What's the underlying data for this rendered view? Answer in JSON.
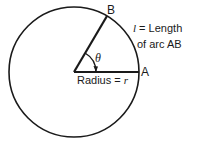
{
  "diagram": {
    "point_b": "B",
    "point_a": "A",
    "theta": "θ",
    "arc_label_line1_var": "l",
    "arc_label_line1_text": " = Length",
    "arc_label_line2": "of arc AB",
    "radius_label_text": "Radius = ",
    "radius_label_var": "r",
    "stroke_color": "#1a1a1a",
    "background_color": "#ffffff"
  }
}
